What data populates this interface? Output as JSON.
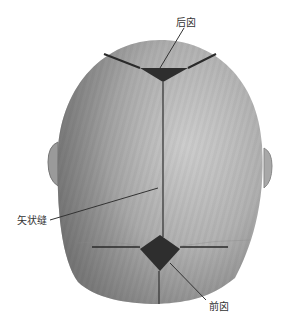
{
  "diagram": {
    "labels": {
      "posterior_fontanelle": "后囟",
      "sagittal_suture": "矢状缝",
      "anterior_fontanelle": "前囟"
    },
    "colors": {
      "skull_light": "#c9c9c9",
      "skull_dark": "#7a7a7a",
      "fontanelle": "#2e2e2e",
      "suture": "#2a2a2a",
      "leader_line": "#333333",
      "label_text": "#333333"
    }
  }
}
